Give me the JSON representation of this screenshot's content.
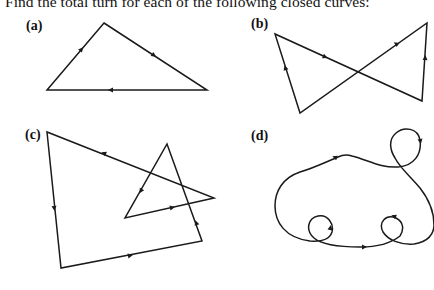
{
  "prompt": "Find the total turn for each of the following closed curves:",
  "panels": [
    {
      "label": "(a)",
      "shape": "triangle",
      "vertices": [
        [
          104,
          23
        ],
        [
          207,
          90
        ],
        [
          47,
          90
        ]
      ],
      "direction": "clockwise",
      "arrows": 3
    },
    {
      "label": "(b)",
      "shape": "bow-tie (self-intersecting quadrilateral)",
      "vertices": [
        [
          300,
          113
        ],
        [
          275,
          34
        ],
        [
          422,
          101
        ],
        [
          427,
          23
        ]
      ],
      "arrows": 4
    },
    {
      "label": "(c)",
      "shape": "self-intersecting hexagon",
      "vertices": [
        [
          47,
          132
        ],
        [
          61,
          268
        ],
        [
          202,
          241
        ],
        [
          167,
          144
        ],
        [
          125,
          218
        ],
        [
          214,
          198
        ]
      ],
      "arrows": 6
    },
    {
      "label": "(d)",
      "shape": "smooth closed curve with three small loops",
      "loops": 3,
      "arrows": 5
    }
  ],
  "colors": {
    "stroke": "#1a1a1a",
    "background": "#ffffff"
  }
}
